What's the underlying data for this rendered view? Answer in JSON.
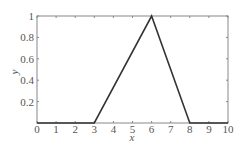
{
  "chart_data": {
    "type": "line",
    "title": "",
    "xlabel": "x",
    "ylabel": "y",
    "xlim": [
      0,
      10
    ],
    "ylim": [
      0,
      1
    ],
    "grid": false,
    "legend": null,
    "x_ticks": [
      0,
      1,
      2,
      3,
      4,
      5,
      6,
      7,
      8,
      9,
      10
    ],
    "x_tick_labels": [
      "0",
      "1",
      "2",
      "3",
      "4",
      "5",
      "6",
      "7",
      "8",
      "9",
      "10"
    ],
    "y_ticks": [
      0.2,
      0.4,
      0.6,
      0.8,
      1
    ],
    "y_tick_labels": [
      "0.2",
      "0.4",
      "0.6",
      "0.8",
      "1"
    ],
    "series": [
      {
        "name": "triangular membership",
        "color": "#333333",
        "x": [
          0,
          3,
          6,
          8,
          10
        ],
        "y": [
          0,
          0,
          1,
          0,
          0
        ]
      }
    ]
  },
  "style": {
    "axis_color": "#888888",
    "line_color": "#333333",
    "text_color": "#555555"
  }
}
